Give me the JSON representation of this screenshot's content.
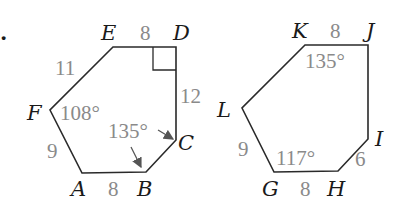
{
  "bullet": ".",
  "figures": [
    {
      "name": "hexagon-ABCDEF",
      "vertices": {
        "A": "A",
        "B": "B",
        "C": "C",
        "D": "D",
        "E": "E",
        "F": "F"
      },
      "sides": {
        "ED": "8",
        "DC": "12",
        "AB": "8",
        "FA": "9",
        "EF": "11"
      },
      "angles": {
        "F": "108°",
        "B_C": "135°"
      },
      "right_angle_at": "D"
    },
    {
      "name": "hexagon-GHIJKL",
      "vertices": {
        "G": "G",
        "H": "H",
        "I": "I",
        "J": "J",
        "K": "K",
        "L": "L"
      },
      "sides": {
        "KJ": "8",
        "GH": "8",
        "HI": "6",
        "LG": "9"
      },
      "angles": {
        "K": "135°",
        "G": "117°"
      }
    }
  ]
}
